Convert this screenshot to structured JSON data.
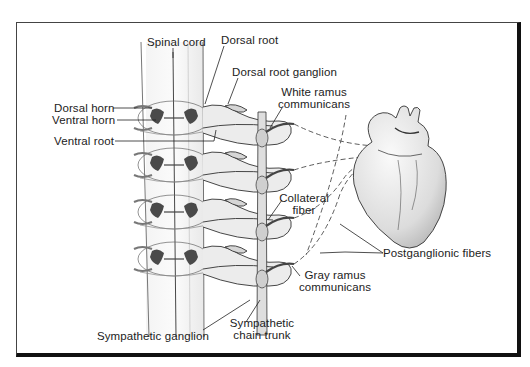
{
  "diagram": {
    "labels": {
      "spinal_cord": "Spinal cord",
      "dorsal_root": "Dorsal root",
      "dorsal_root_ganglion": "Dorsal root ganglion",
      "white_ramus_line1": "White ramus",
      "white_ramus_line2": "communicans",
      "dorsal_horn": "Dorsal horn",
      "ventral_horn": "Ventral horn",
      "ventral_root": "Ventral root",
      "collateral_line1": "Collateral",
      "collateral_line2": "fiber",
      "postganglionic": "Postganglionic fibers",
      "gray_ramus_line1": "Gray ramus",
      "gray_ramus_line2": "communicans",
      "sympathetic_ganglion": "Sympathetic ganglion",
      "chain_trunk_line1": "Sympathetic",
      "chain_trunk_line2": "chain trunk"
    },
    "structures": [
      "spinal-cord",
      "spinal-segments",
      "dorsal-roots",
      "ventral-roots",
      "sympathetic-chain",
      "heart",
      "postganglionic-fibers"
    ],
    "segment_count": 4,
    "colors": {
      "line": "#222222",
      "gray_matter": "#555555",
      "nerve_fill": "#e6e6e6",
      "frame": "#111111"
    }
  }
}
